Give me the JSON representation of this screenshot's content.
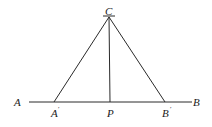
{
  "diagram": {
    "type": "geometry-construction",
    "line": {
      "from": "A",
      "to": "B"
    },
    "points": {
      "C": {
        "label": "C",
        "x": 109,
        "y": 17
      },
      "A": {
        "label": "A",
        "x": 18,
        "y": 106
      },
      "B": {
        "label": "B",
        "x": 197,
        "y": 106
      },
      "A_prime": {
        "label": "A",
        "prime": "′",
        "x": 54,
        "y": 102
      },
      "P": {
        "label": "P",
        "x": 110,
        "y": 102
      },
      "B_prime": {
        "label": "B",
        "prime": "′",
        "x": 165,
        "y": 102
      }
    },
    "segments": [
      [
        "A",
        "B"
      ],
      [
        "C",
        "A_prime"
      ],
      [
        "C",
        "P"
      ],
      [
        "C",
        "B_prime"
      ]
    ],
    "stroke_color": "#2a2a2a"
  }
}
